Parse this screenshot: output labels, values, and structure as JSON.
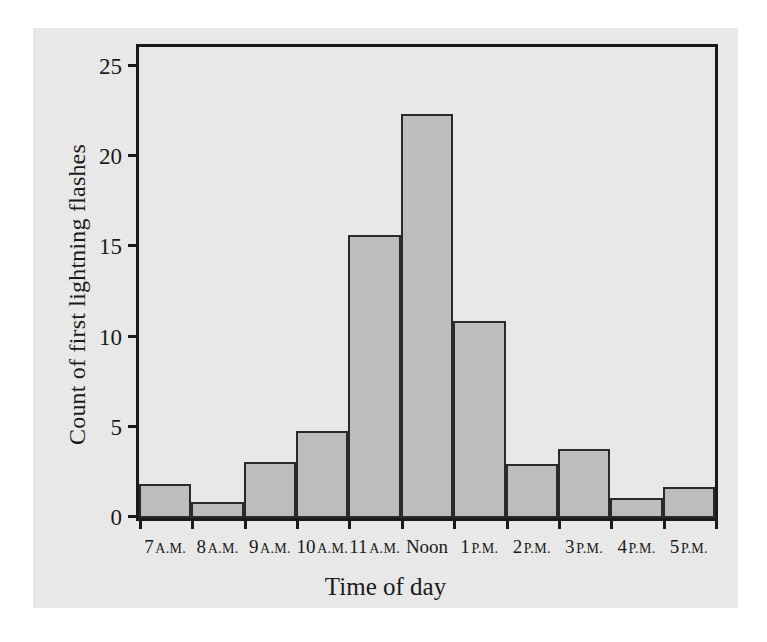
{
  "chart_data": {
    "type": "bar",
    "title": "",
    "xlabel": "Time of day",
    "ylabel": "Count of first lightning flashes",
    "categories": [
      "7 A.M.",
      "8 A.M.",
      "9 A.M.",
      "10 A.M.",
      "11 A.M.",
      "Noon",
      "1 P.M.",
      "2 P.M.",
      "3 P.M.",
      "4 P.M.",
      "5 P.M."
    ],
    "category_parts": [
      {
        "num": "7",
        "suffix": "A.M."
      },
      {
        "num": "8",
        "suffix": "A.M."
      },
      {
        "num": "9",
        "suffix": "A.M."
      },
      {
        "num": "10",
        "suffix": "A.M."
      },
      {
        "num": "11",
        "suffix": "A.M."
      },
      {
        "num": "Noon",
        "suffix": ""
      },
      {
        "num": "1",
        "suffix": "P.M."
      },
      {
        "num": "2",
        "suffix": "P.M."
      },
      {
        "num": "3",
        "suffix": "P.M."
      },
      {
        "num": "4",
        "suffix": "P.M."
      },
      {
        "num": "5",
        "suffix": "P.M."
      }
    ],
    "values": [
      1.9,
      0.9,
      3.1,
      4.8,
      15.7,
      22.4,
      10.9,
      3.0,
      3.8,
      1.1,
      1.7
    ],
    "ylim": [
      0,
      26.1
    ],
    "yticks": [
      0,
      5,
      10,
      15,
      20,
      25
    ],
    "ytick_labels": [
      "0",
      "5",
      "10",
      "15",
      "20",
      "25"
    ],
    "xlim": [
      0,
      11
    ],
    "grid": false,
    "legend": false,
    "bar_fill": "#bdbdbd",
    "bar_edge": "#2a2a2a",
    "axis_color": "#1a1a1a",
    "panel_bg": "#e8e8e8",
    "page_bg": "#ffffff"
  }
}
